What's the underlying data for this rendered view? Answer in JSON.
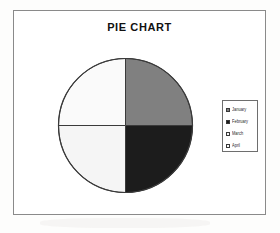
{
  "chart_title": "PIE CHART",
  "legend": {
    "items": [
      {
        "label": "January",
        "color": "#808080"
      },
      {
        "label": "February",
        "color": "#1c1c1c"
      },
      {
        "label": "March",
        "color": "#f5f5f5"
      },
      {
        "label": "April",
        "color": "#fafafa"
      }
    ]
  },
  "chart_data": {
    "type": "pie",
    "title": "PIE CHART",
    "xlabel": "",
    "ylabel": "",
    "legend_position": "right",
    "grid": false,
    "start_angle_deg": 0,
    "direction": "clockwise",
    "labels": [
      "January",
      "February",
      "March",
      "April"
    ],
    "values": [
      25,
      25,
      25,
      25
    ],
    "percentages": [
      25,
      25,
      25,
      25
    ],
    "colors": [
      "#808080",
      "#1c1c1c",
      "#f5f5f5",
      "#fafafa"
    ],
    "slice_outline_color": "#3a3a3a",
    "series": [
      {
        "name": "Months",
        "values": [
          25,
          25,
          25,
          25
        ]
      }
    ]
  },
  "style": {
    "frame_border_color": "#8a8a8a",
    "legend_border_color": "#6e6e6e",
    "title_color": "#111111",
    "background": "#ffffff"
  }
}
